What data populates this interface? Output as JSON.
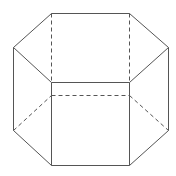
{
  "diagram": {
    "stroke_color": "#555555",
    "background": "#ffffff",
    "solid_edges": [
      [
        51,
        13,
        129,
        13
      ],
      [
        129,
        13,
        168,
        47
      ],
      [
        168,
        47,
        129,
        82
      ],
      [
        129,
        82,
        51,
        82
      ],
      [
        51,
        82,
        13,
        47
      ],
      [
        13,
        47,
        51,
        13
      ],
      [
        13,
        47,
        13,
        130
      ],
      [
        168,
        47,
        168,
        130
      ],
      [
        51,
        82,
        51,
        165
      ],
      [
        129,
        82,
        129,
        165
      ],
      [
        13,
        130,
        51,
        165
      ],
      [
        51,
        165,
        129,
        165
      ],
      [
        129,
        165,
        168,
        130
      ]
    ],
    "hidden_edges": [
      [
        51,
        13,
        51,
        95
      ],
      [
        129,
        13,
        129,
        95
      ],
      [
        51,
        95,
        129,
        95
      ],
      [
        13,
        130,
        51,
        95
      ],
      [
        129,
        95,
        168,
        130
      ]
    ]
  }
}
